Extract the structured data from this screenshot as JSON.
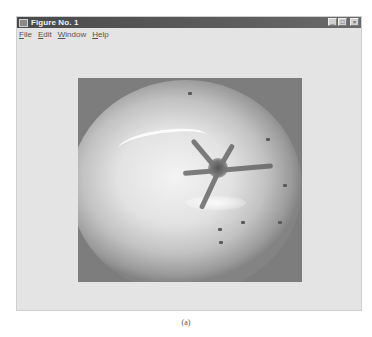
{
  "window": {
    "title": "Figure No. 1",
    "controls": {
      "minimize": "_",
      "maximize": "□",
      "close": "×"
    }
  },
  "menubar": {
    "items": [
      {
        "label": "File",
        "mnemonic": "F",
        "rest": "ile"
      },
      {
        "label": "Edit",
        "mnemonic": "E",
        "rest": "dit"
      },
      {
        "label": "Window",
        "mnemonic": "W",
        "rest": "indow"
      },
      {
        "label": "Help",
        "mnemonic": "H",
        "rest": "elp"
      }
    ]
  },
  "figure": {
    "image_description": "grayscale photograph of a tomato viewed from above showing stem and calyx"
  },
  "caption": "(a)"
}
